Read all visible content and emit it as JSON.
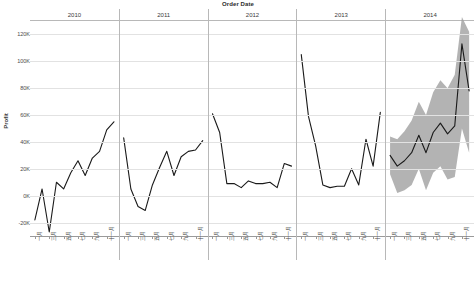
{
  "chart_data": {
    "type": "line",
    "title": "Order Date",
    "xlabel": "Order Date",
    "ylabel": "Profit",
    "ylim": [
      -30000,
      130000
    ],
    "yticks": [
      120000,
      100000,
      80000,
      60000,
      40000,
      20000,
      0,
      -20000
    ],
    "ytick_labels": [
      "120K",
      "100K",
      "80K",
      "60K",
      "40K",
      "20K",
      "0K",
      "-20K"
    ],
    "grid": true,
    "legend": "none",
    "line_color": "#1a1a1a",
    "band_color": "#9e9e9e",
    "panels": [
      "2010",
      "2011",
      "2012",
      "2013",
      "2014"
    ],
    "month_tick_labels": [
      "一月",
      "三月",
      "五月",
      "七月",
      "九月",
      "十一月"
    ],
    "month_labels_all": [
      "一月",
      "二月",
      "三月",
      "四月",
      "五月",
      "六月",
      "七月",
      "八月",
      "九月",
      "十月",
      "十一月",
      "十二月"
    ],
    "annotation": "2014 panel shows forecast with shaded confidence interval band",
    "series": [
      {
        "name": "Profit",
        "kind": "actual",
        "categories": [
          "2010-01",
          "2010-02",
          "2010-03",
          "2010-04",
          "2010-05",
          "2010-06",
          "2010-07",
          "2010-08",
          "2010-09",
          "2010-10",
          "2010-11",
          "2010-12",
          "2011-01",
          "2011-02",
          "2011-03",
          "2011-04",
          "2011-05",
          "2011-06",
          "2011-07",
          "2011-08",
          "2011-09",
          "2011-10",
          "2011-11",
          "2011-12",
          "2012-01",
          "2012-02",
          "2012-03",
          "2012-04",
          "2012-05",
          "2012-06",
          "2012-07",
          "2012-08",
          "2012-09",
          "2012-10",
          "2012-11",
          "2012-12",
          "2013-01",
          "2013-02",
          "2013-03",
          "2013-04",
          "2013-05",
          "2013-06",
          "2013-07",
          "2013-08",
          "2013-09",
          "2013-10",
          "2013-11",
          "2013-12"
        ],
        "values": [
          -18000,
          5000,
          -27000,
          10000,
          5000,
          17000,
          26000,
          15000,
          28000,
          33000,
          49000,
          55000,
          43000,
          5000,
          -8000,
          -11000,
          8000,
          21000,
          33000,
          15000,
          29000,
          33000,
          34000,
          41000,
          61000,
          47000,
          9000,
          9000,
          6000,
          11000,
          9000,
          9000,
          10000,
          6000,
          24000,
          22000,
          105000,
          59000,
          37000,
          8000,
          6000,
          7000,
          7000,
          20000,
          8000,
          42000,
          22000,
          62000,
          100000,
          78000
        ]
      },
      {
        "name": "Profit Forecast",
        "kind": "forecast",
        "categories": [
          "2014-01",
          "2014-02",
          "2014-03",
          "2014-04",
          "2014-05",
          "2014-06",
          "2014-07",
          "2014-08",
          "2014-09",
          "2014-10",
          "2014-11",
          "2014-12"
        ],
        "values": [
          30000,
          22000,
          26000,
          32000,
          45000,
          32000,
          47000,
          54000,
          46000,
          52000,
          113000,
          78000
        ],
        "upper": [
          44000,
          42000,
          48000,
          56000,
          70000,
          60000,
          77000,
          86000,
          80000,
          90000,
          133000,
          122000
        ],
        "lower": [
          16000,
          2000,
          4000,
          8000,
          20000,
          4000,
          17000,
          22000,
          12000,
          14000,
          50000,
          32000
        ]
      }
    ]
  },
  "axis": {
    "y_title": "Profit",
    "ticks": [
      {
        "label": "120K",
        "value": 120000
      },
      {
        "label": "100K",
        "value": 100000
      },
      {
        "label": "80K",
        "value": 80000
      },
      {
        "label": "60K",
        "value": 60000
      },
      {
        "label": "40K",
        "value": 40000
      },
      {
        "label": "20K",
        "value": 20000
      },
      {
        "label": "0K",
        "value": 0
      },
      {
        "label": "-20K",
        "value": -20000
      }
    ]
  },
  "header": {
    "title": "Order Date",
    "years": [
      {
        "label": "2010"
      },
      {
        "label": "2011"
      },
      {
        "label": "2012"
      },
      {
        "label": "2013"
      },
      {
        "label": "2014"
      }
    ]
  }
}
